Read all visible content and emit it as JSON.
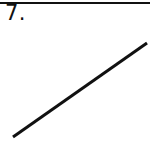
{
  "figure": {
    "item_number": "7.",
    "background_color": "#ffffff",
    "ink_color": "#111111",
    "width": 150,
    "height": 149,
    "top_rule": {
      "name": "horizontal-rule",
      "x1": 0,
      "y1": 3,
      "x2": 150,
      "y2": 3,
      "thickness": 2,
      "color": "#111111"
    }
  },
  "chart_data": {
    "type": "line",
    "title": "7.",
    "xlabel": "",
    "ylabel": "",
    "grid": false,
    "legend": null,
    "axes_shown": false,
    "tick_labels": [],
    "annotations": [],
    "xlim": [
      0,
      150
    ],
    "ylim": [
      0,
      149
    ],
    "series": [
      {
        "name": "line-segment",
        "color": "#111111",
        "linewidth": 3,
        "x": [
          13,
          147
        ],
        "y": [
          137,
          43
        ],
        "points": [
          {
            "label": "lower-left-endpoint",
            "x": 13,
            "y": 137
          },
          {
            "label": "upper-right-endpoint",
            "x": 147,
            "y": 43
          }
        ]
      }
    ]
  }
}
